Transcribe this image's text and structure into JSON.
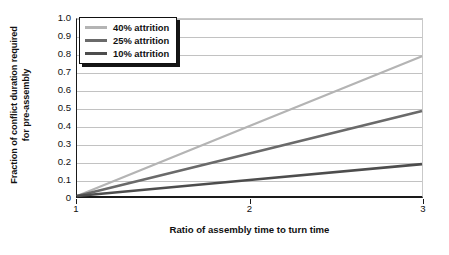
{
  "chart_data": {
    "type": "line",
    "title": "",
    "xlabel": "Ratio of assembly time to turn time",
    "ylabel_line1": "Fraction of conflict duration required",
    "ylabel_line2": "for pre-assembly",
    "xlim": [
      1,
      3
    ],
    "ylim": [
      0,
      1.0
    ],
    "xticks": [
      1,
      2,
      3
    ],
    "xticklabels": [
      "1",
      "2",
      "3"
    ],
    "yticks": [
      0,
      0.1,
      0.2,
      0.3,
      0.4,
      0.5,
      0.6,
      0.7,
      0.8,
      0.9,
      1.0
    ],
    "yticklabels": [
      "0",
      "0.1",
      "0.2",
      "0.3",
      "0.4",
      "0.5",
      "0.6",
      "0.7",
      "0.8",
      "0.9",
      "1.0"
    ],
    "grid": "horizontal",
    "legend_position": "upper-left",
    "series": [
      {
        "name": "40% attrition",
        "color": "#b4b4b4",
        "linewidth": 2.2,
        "x": [
          1,
          2,
          3
        ],
        "values": [
          0.0,
          0.395,
          0.79
        ]
      },
      {
        "name": "25% attrition",
        "color": "#6a6a6a",
        "linewidth": 2.6,
        "x": [
          1,
          2,
          3
        ],
        "values": [
          0.0,
          0.24,
          0.48
        ]
      },
      {
        "name": "10% attrition",
        "color": "#4d4d4d",
        "linewidth": 2.6,
        "x": [
          1,
          2,
          3
        ],
        "values": [
          0.0,
          0.09,
          0.18
        ]
      }
    ]
  },
  "legend": {
    "items": [
      {
        "label": "40% attrition",
        "color": "#b4b4b4"
      },
      {
        "label": "25% attrition",
        "color": "#6a6a6a"
      },
      {
        "label": "10% attrition",
        "color": "#4d4d4d"
      }
    ]
  },
  "colors": {
    "axis": "#1a1a1a",
    "grid": "#c2c2c2",
    "background": "#ffffff",
    "text": "#111111"
  }
}
